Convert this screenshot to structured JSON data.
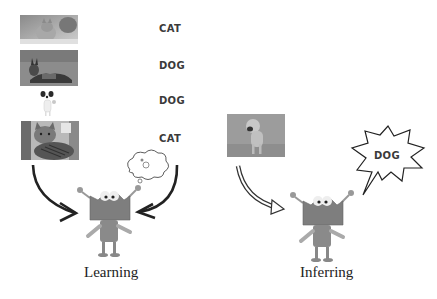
{
  "training_examples": [
    {
      "image": "cat-photo",
      "label": "CAT"
    },
    {
      "image": "german-shepherd-photo",
      "label": "DOG"
    },
    {
      "image": "small-terrier-photo",
      "label": "DOG"
    },
    {
      "image": "tabby-cat-photo",
      "label": "CAT"
    }
  ],
  "learning": {
    "caption": "Learning",
    "thought_icon": "thought-cloud-icon"
  },
  "inferring": {
    "caption": "Inferring",
    "input_image": "dog-photo",
    "prediction": "DOG"
  },
  "colors": {
    "background": "#ffffff",
    "text": "#3a3a3a",
    "arrow": "#222222"
  }
}
